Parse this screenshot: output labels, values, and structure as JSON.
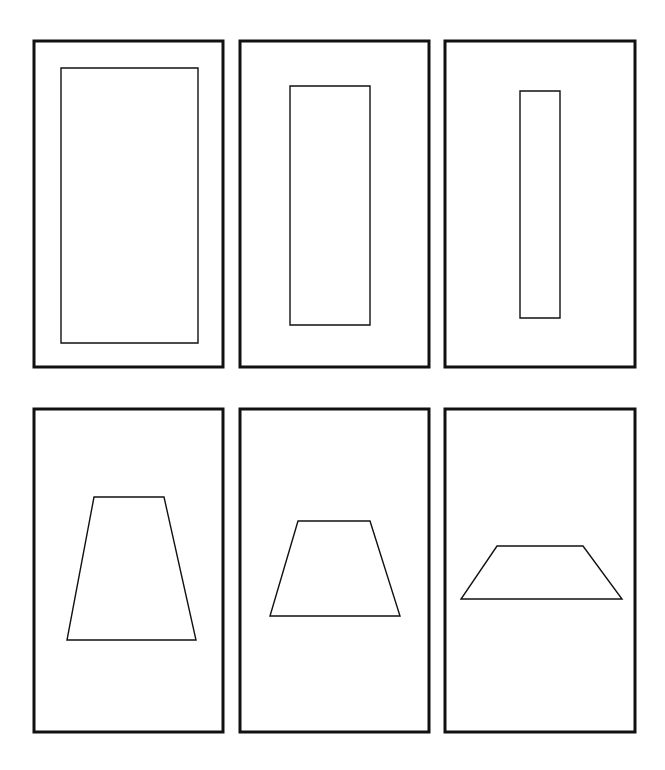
{
  "canvas": {
    "width": 665,
    "height": 770,
    "background": "#ffffff"
  },
  "style": {
    "frame_stroke": "#111111",
    "frame_width": 3,
    "shape_stroke": "#111111",
    "shape_width": 1.4
  },
  "panels": [
    {
      "id": "panel-1",
      "row": 1,
      "frame": [
        34,
        41,
        189,
        326
      ],
      "shape": "rect",
      "points": [
        [
          61,
          68
        ],
        [
          198,
          68
        ],
        [
          198,
          343
        ],
        [
          61,
          343
        ]
      ]
    },
    {
      "id": "panel-2",
      "row": 1,
      "frame": [
        240,
        41,
        189,
        326
      ],
      "shape": "rect",
      "points": [
        [
          290,
          86
        ],
        [
          370,
          86
        ],
        [
          370,
          325
        ],
        [
          290,
          325
        ]
      ]
    },
    {
      "id": "panel-3",
      "row": 1,
      "frame": [
        445,
        41,
        190,
        326
      ],
      "shape": "rect",
      "points": [
        [
          520,
          91
        ],
        [
          560,
          91
        ],
        [
          560,
          318
        ],
        [
          520,
          318
        ]
      ]
    },
    {
      "id": "panel-4",
      "row": 2,
      "frame": [
        34,
        409,
        189,
        323
      ],
      "shape": "trapezoid",
      "points": [
        [
          94,
          497
        ],
        [
          164,
          497
        ],
        [
          196,
          640
        ],
        [
          67,
          640
        ]
      ]
    },
    {
      "id": "panel-5",
      "row": 2,
      "frame": [
        240,
        409,
        189,
        323
      ],
      "shape": "trapezoid",
      "points": [
        [
          298,
          521
        ],
        [
          370,
          521
        ],
        [
          400,
          616
        ],
        [
          270,
          616
        ]
      ]
    },
    {
      "id": "panel-6",
      "row": 2,
      "frame": [
        445,
        409,
        190,
        323
      ],
      "shape": "trapezoid",
      "points": [
        [
          497,
          546
        ],
        [
          583,
          546
        ],
        [
          622,
          599
        ],
        [
          461,
          599
        ]
      ]
    }
  ]
}
